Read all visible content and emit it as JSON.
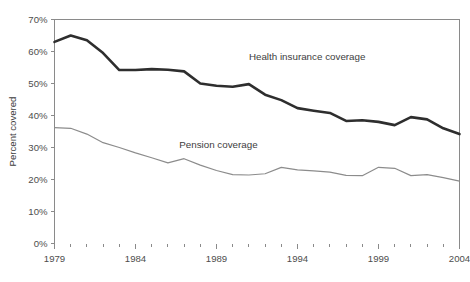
{
  "chart_data": {
    "type": "line",
    "title": "",
    "subtitle": "",
    "xlabel": "",
    "ylabel": "Percent covered",
    "xlim": [
      1979,
      2004
    ],
    "ylim": [
      0,
      70
    ],
    "grid": false,
    "legend_position": "inline-annotation",
    "x": [
      1979,
      1980,
      1981,
      1982,
      1983,
      1984,
      1985,
      1986,
      1987,
      1988,
      1989,
      1990,
      1991,
      1992,
      1993,
      1994,
      1995,
      1996,
      1997,
      1998,
      1999,
      2000,
      2001,
      2002,
      2003,
      2004
    ],
    "x_tick_labels": [
      "1979",
      "1984",
      "1989",
      "1994",
      "1999",
      "2004"
    ],
    "x_tick_values": [
      1979,
      1984,
      1989,
      1994,
      1999,
      2004
    ],
    "y_tick_labels": [
      "0%",
      "10%",
      "20%",
      "30%",
      "40%",
      "50%",
      "60%",
      "70%"
    ],
    "y_tick_values": [
      0,
      10,
      20,
      30,
      40,
      50,
      60,
      70
    ],
    "series": [
      {
        "name": "Health insurance coverage",
        "color": "#2e2e2e",
        "label_x": 1991.0,
        "label_y": 57.5,
        "values": [
          63.0,
          65.0,
          63.5,
          59.5,
          54.2,
          54.2,
          54.5,
          54.3,
          53.8,
          50.0,
          49.3,
          49.0,
          49.8,
          46.5,
          44.8,
          42.3,
          41.5,
          40.8,
          38.3,
          38.5,
          38.0,
          37.0,
          39.5,
          38.8,
          36.0,
          34.2
        ]
      },
      {
        "name": "Pension coverage",
        "color": "#8c8c8c",
        "label_x": 1986.7,
        "label_y": 29.8,
        "values": [
          36.2,
          36.0,
          34.2,
          31.5,
          30.0,
          28.3,
          26.8,
          25.2,
          26.5,
          24.5,
          22.8,
          21.5,
          21.4,
          21.8,
          23.8,
          23.0,
          22.7,
          22.3,
          21.3,
          21.2,
          23.8,
          23.5,
          21.2,
          21.5,
          20.6,
          19.5
        ]
      }
    ]
  }
}
